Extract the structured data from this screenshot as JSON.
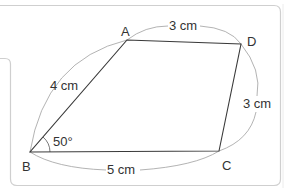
{
  "figure": {
    "type": "quadrilateral",
    "vertices": {
      "A": {
        "label": "A"
      },
      "B": {
        "label": "B"
      },
      "C": {
        "label": "C"
      },
      "D": {
        "label": "D"
      }
    },
    "sides": {
      "AB": {
        "label": "4 cm"
      },
      "AD": {
        "label": "3 cm"
      },
      "DC": {
        "label": "3 cm"
      },
      "BC": {
        "label": "5 cm"
      }
    },
    "angle_B": {
      "label": "50°"
    }
  },
  "colors": {
    "line": "#3a3a3a",
    "arc": "#9a9a9a",
    "frame": "#c8c8c8",
    "text": "#333333"
  }
}
